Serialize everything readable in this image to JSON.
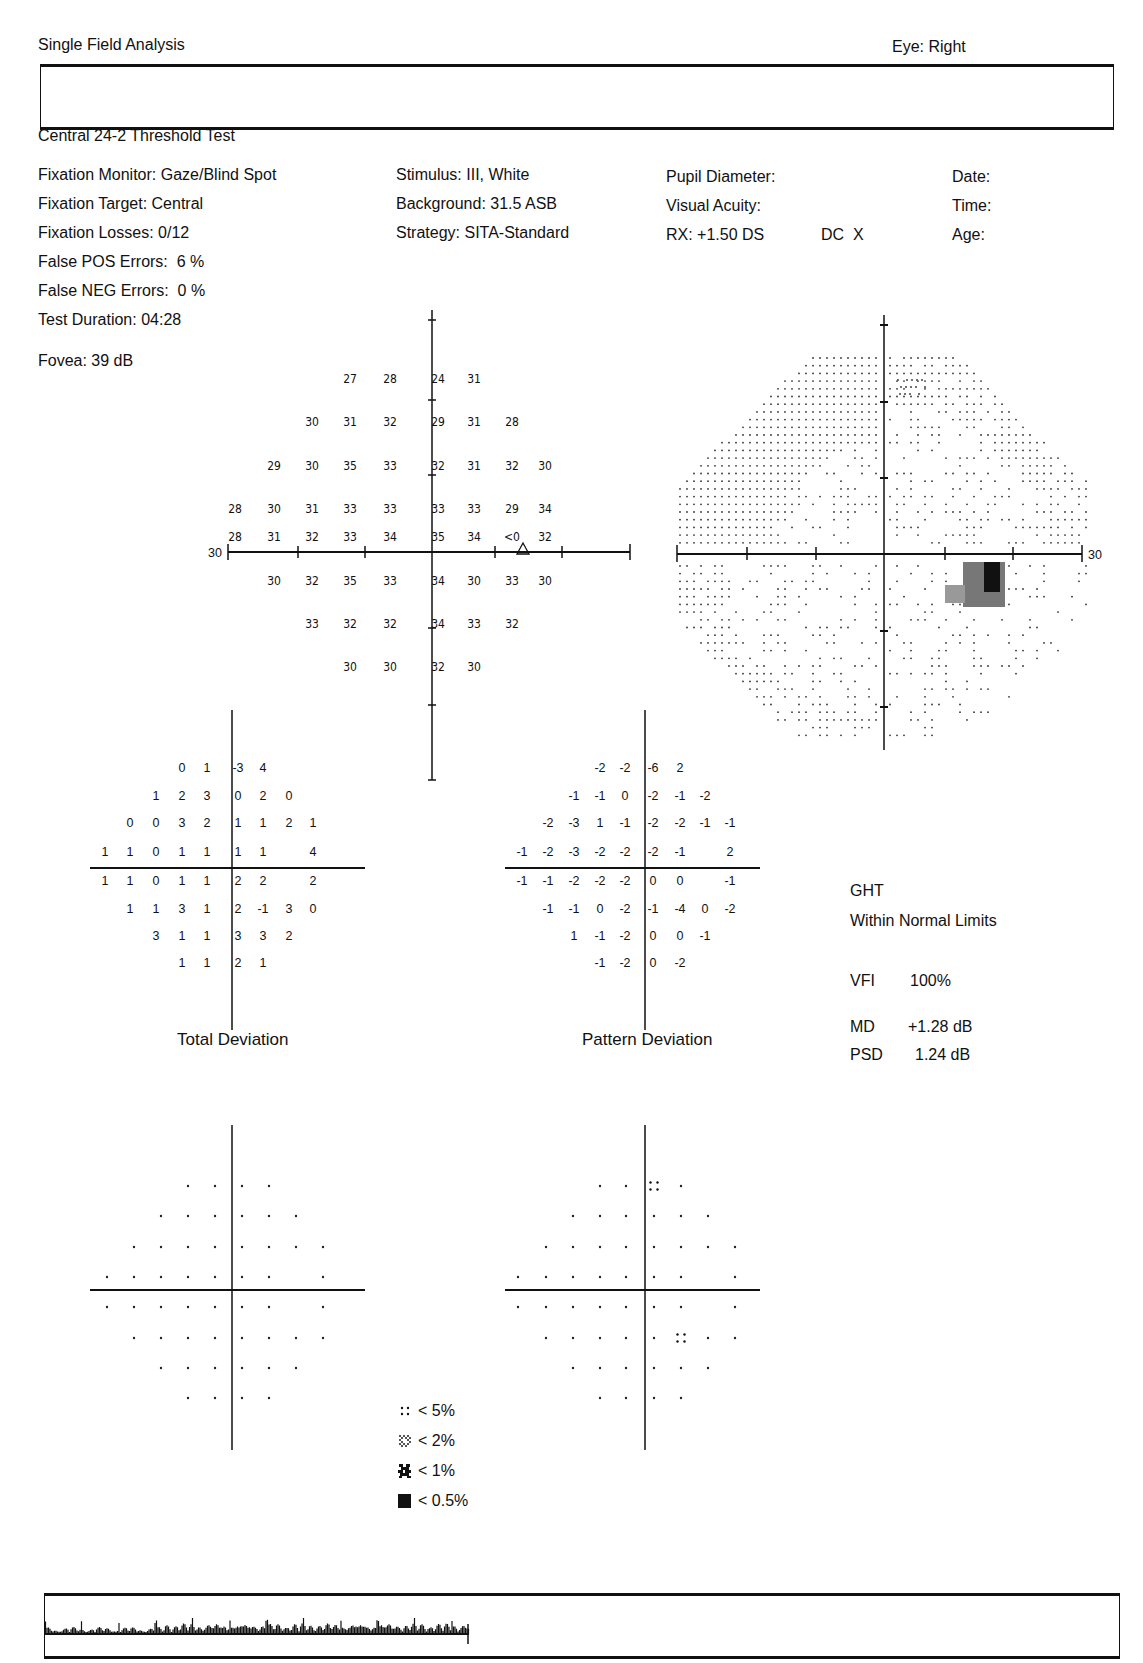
{
  "header": {
    "title": "Single Field Analysis",
    "eye": "Eye: Right",
    "test_name": "Central 24-2 Threshold Test"
  },
  "info": {
    "col1": [
      "Fixation Monitor: Gaze/Blind Spot",
      "Fixation Target: Central",
      "Fixation Losses: 0/12",
      "False POS Errors:  6 %",
      "False NEG Errors:  0 %",
      "Test Duration: 04:28"
    ],
    "fovea": "Fovea: 39 dB",
    "col2": [
      "Stimulus: III, White",
      "Background: 31.5 ASB",
      "Strategy: SITA-Standard"
    ],
    "col3": [
      "Pupil Diameter:",
      "Visual Acuity:",
      "RX: +1.50 DS"
    ],
    "rx_dc": "DC  X",
    "col4": [
      "Date:",
      "Time:",
      "Age:"
    ]
  },
  "threshold_plot": {
    "axis_label_left": "30",
    "rows": [
      [
        "",
        "",
        "27",
        "28",
        "24",
        "31",
        "",
        ""
      ],
      [
        "",
        "30",
        "31",
        "32",
        "29",
        "31",
        "28",
        ""
      ],
      [
        "29",
        "30",
        "35",
        "33",
        "32",
        "31",
        "32",
        "30"
      ],
      [
        "28",
        "30",
        "31",
        "33",
        "33",
        "33",
        "33",
        "29",
        "34"
      ],
      [
        "28",
        "31",
        "32",
        "33",
        "34",
        "35",
        "34",
        "<0",
        "32"
      ],
      [
        "30",
        "32",
        "35",
        "33",
        "34",
        "30",
        "33",
        "30"
      ],
      [
        "",
        "33",
        "32",
        "32",
        "34",
        "33",
        "32",
        ""
      ],
      [
        "",
        "",
        "30",
        "30",
        "32",
        "30",
        "",
        ""
      ]
    ]
  },
  "grayscale_plot": {
    "axis_label_right": "30"
  },
  "total_deviation": {
    "title": "Total Deviation",
    "rows": [
      [
        "",
        "",
        "0",
        "1",
        "-3",
        "4",
        "",
        ""
      ],
      [
        "",
        "1",
        "2",
        "3",
        "0",
        "2",
        "0",
        ""
      ],
      [
        "0",
        "0",
        "3",
        "2",
        "1",
        "1",
        "2",
        "1"
      ],
      [
        "1",
        "1",
        "0",
        "1",
        "1",
        "1",
        "1",
        "",
        "4"
      ],
      [
        "1",
        "1",
        "0",
        "1",
        "1",
        "2",
        "2",
        "",
        "2"
      ],
      [
        "1",
        "1",
        "3",
        "1",
        "2",
        "-1",
        "3",
        "0"
      ],
      [
        "",
        "3",
        "1",
        "1",
        "3",
        "3",
        "2",
        ""
      ],
      [
        "",
        "",
        "1",
        "1",
        "2",
        "1",
        "",
        ""
      ]
    ]
  },
  "pattern_deviation": {
    "title": "Pattern Deviation",
    "rows": [
      [
        "",
        "",
        "-2",
        "-2",
        "-6",
        "2",
        "",
        ""
      ],
      [
        "",
        "-1",
        "-1",
        "0",
        "-2",
        "-1",
        "-2",
        ""
      ],
      [
        "-2",
        "-3",
        "1",
        "-1",
        "-2",
        "-2",
        "-1",
        "-1"
      ],
      [
        "-1",
        "-2",
        "-3",
        "-2",
        "-2",
        "-2",
        "-1",
        "",
        "2"
      ],
      [
        "-1",
        "-1",
        "-2",
        "-2",
        "-2",
        "0",
        "0",
        "",
        "-1"
      ],
      [
        "-1",
        "-1",
        "0",
        "-2",
        "-1",
        "-4",
        "0",
        "-2"
      ],
      [
        "",
        "1",
        "-1",
        "-2",
        "0",
        "0",
        "-1",
        ""
      ],
      [
        "",
        "",
        "-1",
        "-2",
        "0",
        "-2",
        "",
        ""
      ]
    ]
  },
  "total_deviation_prob": {
    "flags": [
      [
        0,
        4,
        "p5"
      ]
    ]
  },
  "pattern_deviation_prob": {
    "flags": [
      [
        0,
        4,
        "p5"
      ],
      [
        5,
        5,
        "p5"
      ]
    ]
  },
  "indices": {
    "ght_label": "GHT",
    "ght_value": "Within Normal Limits",
    "vfi_label": "VFI",
    "vfi_value": "100%",
    "md_label": "MD",
    "md_value": "+1.28 dB",
    "psd_label": "PSD",
    "psd_value": "1.24 dB"
  },
  "legend": [
    {
      "symbol": "dots-4-icon",
      "label": "< 5%"
    },
    {
      "symbol": "checker-light-icon",
      "label": "< 2%"
    },
    {
      "symbol": "checker-dark-icon",
      "label": "< 1%"
    },
    {
      "symbol": "solid-square-icon",
      "label": "< 0.5%"
    }
  ]
}
